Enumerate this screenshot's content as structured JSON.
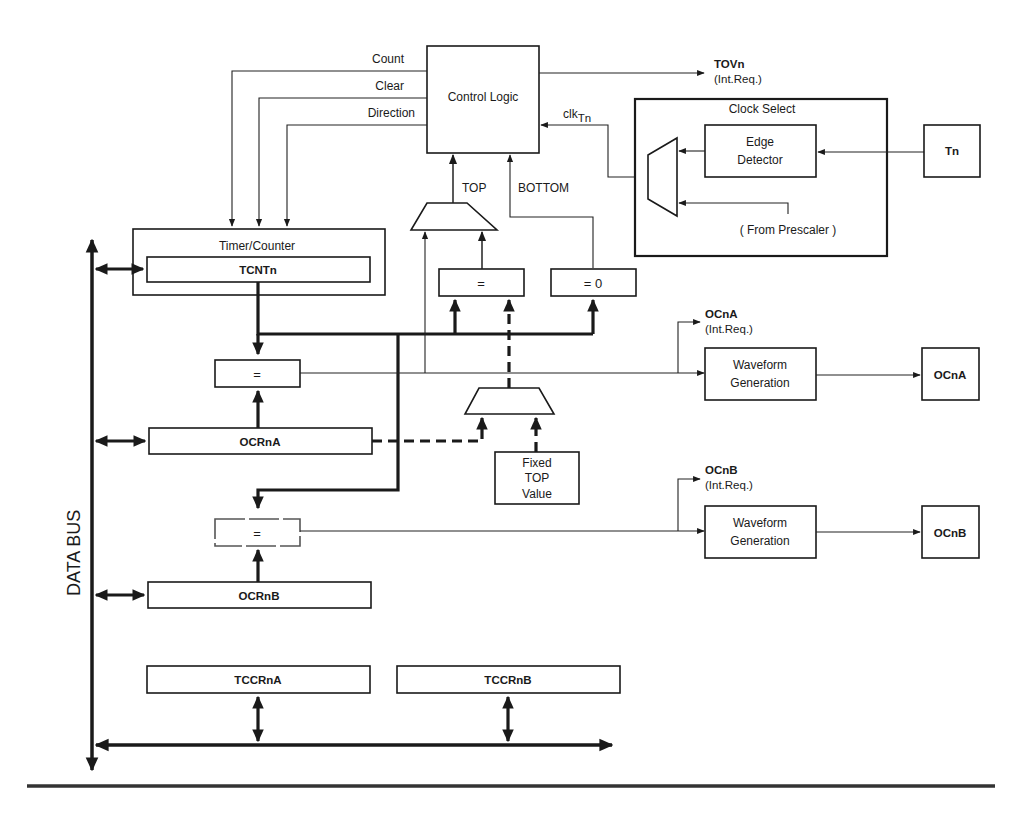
{
  "diagram": {
    "control_logic": {
      "label": "Control Logic",
      "outputs": [
        "Count",
        "Clear",
        "Direction"
      ],
      "interrupt": {
        "name": "TOVn",
        "type": "(Int.Req.)"
      },
      "clock_input": "clk",
      "clock_input_sub": "Tn"
    },
    "clock_select": {
      "label": "Clock Select",
      "edge_detector": [
        "Edge",
        "Detector"
      ],
      "prescaler_label": "( From Prescaler )",
      "pin": "Tn"
    },
    "top_label": "TOP",
    "bottom_label": "BOTTOM",
    "timer_counter": {
      "label": "Timer/Counter",
      "register": "TCNTn"
    },
    "comparators": {
      "top_equal": "=",
      "zero": "= 0",
      "ocra_equal": "=",
      "ocrb_equal": "="
    },
    "fixed_top": [
      "Fixed",
      "TOP",
      "Value"
    ],
    "registers": {
      "ocra": "OCRnA",
      "ocrb": "OCRnB",
      "tccra": "TCCRnA",
      "tccrb": "TCCRnB"
    },
    "channel_a": {
      "interrupt": {
        "name": "OCnA",
        "type": "(Int.Req.)"
      },
      "waveform": [
        "Waveform",
        "Generation"
      ],
      "pin": "OCnA"
    },
    "channel_b": {
      "interrupt": {
        "name": "OCnB",
        "type": "(Int.Req.)"
      },
      "waveform": [
        "Waveform",
        "Generation"
      ],
      "pin": "OCnB"
    },
    "data_bus_label": "DATA BUS"
  }
}
